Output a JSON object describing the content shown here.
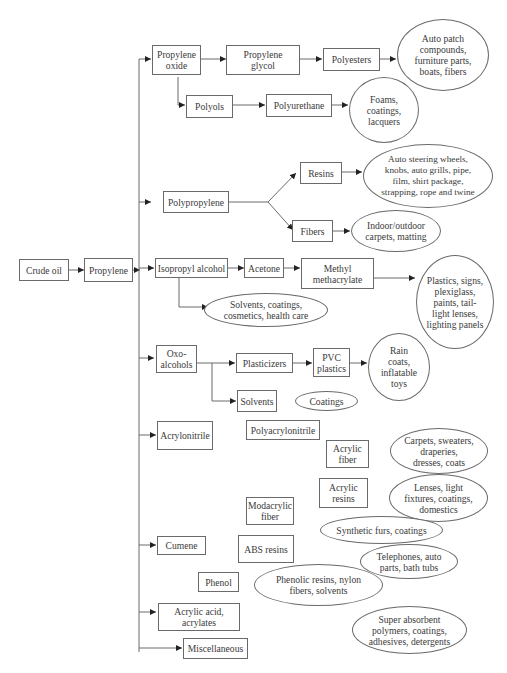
{
  "diagram": {
    "root": "Crude oil",
    "nodes": {
      "crude_oil": "Crude oil",
      "propylene": "Propylene",
      "propylene_oxide": "Propylene\noxide",
      "propylene_glycol": "Propylene\nglycol",
      "polyesters": "Polyesters",
      "polyesters_uses": "Auto patch\ncompounds,\nfurniture parts,\nboats, fibers",
      "polyols": "Polyols",
      "polyurethane": "Polyurethane",
      "polyurethane_uses": "Foams,\ncoatings,\nlacquers",
      "polypropylene": "Polypropylene",
      "resins": "Resins",
      "resins_uses": "Auto steering wheels,\nknobs, auto grills, pipe,\nfilm, shirt package,\nstrapping, rope and twine",
      "fibers": "Fibers",
      "fibers_uses": "Indoor/outdoor\ncarpets, matting",
      "isopropyl_alcohol": "Isopropyl alcohol",
      "acetone": "Acetone",
      "methyl_methacrylate": "Methyl\nmethacrylate",
      "mma_uses": "Plastics, signs,\nplexiglass,\npaints, tail-\nlight lenses,\nlighting panels",
      "ipa_uses": "Solvents, coatings,\ncosmetics, health care",
      "oxo_alcohols": "Oxo-\nalcohols",
      "plasticizers": "Plasticizers",
      "pvc_plastics": "PVC\nplastics",
      "pvc_uses": "Rain\ncoats,\ninflatable\ntoys",
      "solvents": "Solvents",
      "coatings": "Coatings",
      "acrylonitrile": "Acrylonitrile",
      "polyacrylonitrile": "Polyacrylonitrile",
      "acrylic_fiber": "Acrylic\nfiber",
      "acrylic_fiber_uses": "Carpets, sweaters,\ndraperies,\ndresses, coats",
      "acrylic_resins": "Acrylic\nresins",
      "acrylic_resins_uses": "Lenses, light\nfixtures, coatings,\ndomestics",
      "modacrylic_fiber": "Modacrylic\nfiber",
      "modacrylic_uses": "Synthetic furs, coatings",
      "cumene": "Cumene",
      "abs_resins": "ABS resins",
      "abs_uses": "Telephones, auto\nparts, bath tubs",
      "phenol": "Phenol",
      "phenol_uses": "Phenolic resins, nylon\nfibers, solvents",
      "acrylic_acid": "Acrylic acid,\nacrylates",
      "acrylic_acid_uses": "Super absorbent\npolymers, coatings,\nadhesives, detergents",
      "miscellaneous": "Miscellaneous"
    },
    "colors": {
      "line": "#6a6a6a",
      "text": "#3a3a3a",
      "background": "#ffffff"
    }
  }
}
